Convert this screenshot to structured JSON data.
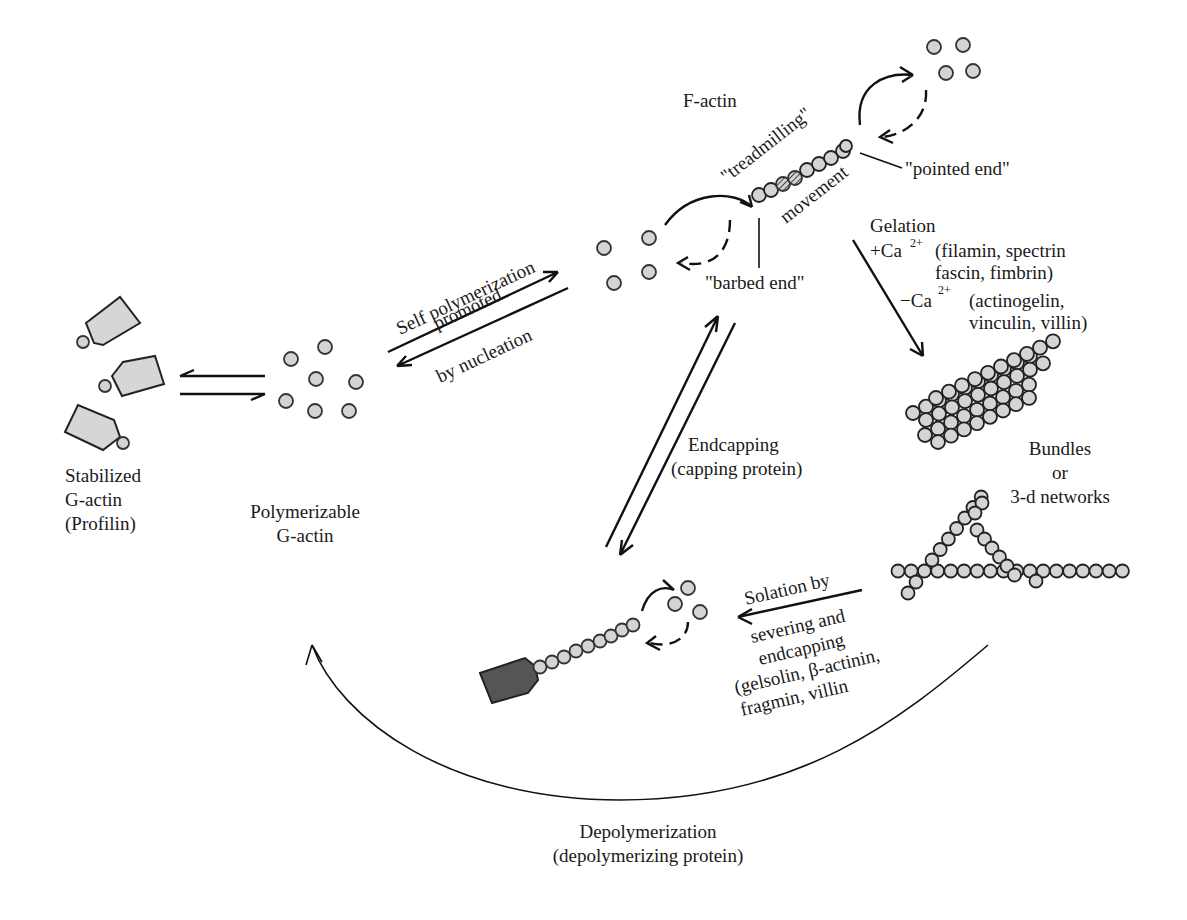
{
  "diagram": {
    "type": "actin polymerization cycle",
    "nodes": {
      "stabilized": {
        "line1": "Stabilized",
        "line2": "G-actin",
        "line3": "(Profilin)"
      },
      "polymerizable": {
        "line1": "Polymerizable",
        "line2": "G-actin"
      },
      "factin": {
        "title": "F-actin",
        "treadmilling": "\"treadmilling\"",
        "movement": "movement",
        "pointed_end": "\"pointed end\"",
        "barbed_end": "\"barbed end\""
      },
      "bundles": {
        "line1": "Bundles",
        "line2": "or",
        "line3": "3-d networks"
      }
    },
    "edges": {
      "self_polymerization": {
        "line1": "Self polymerization",
        "line2": "promoted",
        "line3": "by nucleation"
      },
      "gelation": {
        "title": "Gelation",
        "plus_ca": "+Ca",
        "plus_ca_sup": "2+",
        "plus_ca_proteins_1": "(filamin, spectrin",
        "plus_ca_proteins_2": "fascin, fimbrin)",
        "minus_ca": "−Ca",
        "minus_ca_sup": "2+",
        "minus_ca_proteins_1": "(actinogelin,",
        "minus_ca_proteins_2": "vinculin, villin)"
      },
      "endcapping": {
        "line1": "Endcapping",
        "line2": "(capping protein)"
      },
      "solation": {
        "line1": "Solation by",
        "line2": "severing and",
        "line3": "endcapping",
        "line4": "(gelsolin, β-actinin,",
        "line5": "fragmin, villin"
      },
      "depolymerization": {
        "line1": "Depolymerization",
        "line2": "(depolymerizing protein)"
      }
    },
    "colors": {
      "monomer_fill": "#d4d4d4",
      "cap_fill": "#555555",
      "ink": "#111111"
    }
  }
}
